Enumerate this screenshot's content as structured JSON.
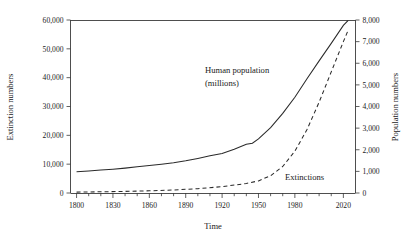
{
  "chart_data": {
    "type": "line",
    "title": "",
    "xlabel": "Time",
    "ylabel": "Extinction numbers",
    "y2label": "Population numbers",
    "grid": false,
    "legend_position": "inline-annotations",
    "xlim": [
      1795,
      2030
    ],
    "ylim": [
      0,
      60000
    ],
    "y2lim": [
      0,
      8000
    ],
    "x_tick_labels": [
      "1800",
      "1830",
      "1860",
      "1890",
      "1920",
      "1950",
      "1980",
      "2020"
    ],
    "x_tick_values": [
      1800,
      1830,
      1860,
      1890,
      1920,
      1950,
      1980,
      2020
    ],
    "x_minor_tick_step": 10,
    "y_tick_labels": [
      "0",
      "10,000",
      "20,000",
      "30,000",
      "40,000",
      "50,000",
      "60,000"
    ],
    "y_tick_values": [
      0,
      10000,
      20000,
      30000,
      40000,
      50000,
      60000
    ],
    "y2_tick_labels": [
      "0",
      "1,000",
      "2,000",
      "3,000",
      "4,000",
      "5,000",
      "6,000",
      "7,000",
      "8,000"
    ],
    "y2_tick_values": [
      0,
      1000,
      2000,
      3000,
      4000,
      5000,
      6000,
      7000,
      8000
    ],
    "series": [
      {
        "name": "Human population (millions)",
        "style": "solid",
        "axis": "right",
        "annotation": "Human population\n(millions)",
        "x": [
          1800,
          1810,
          1820,
          1830,
          1840,
          1850,
          1860,
          1870,
          1880,
          1890,
          1900,
          1910,
          1920,
          1930,
          1940,
          1945,
          1950,
          1960,
          1970,
          1980,
          1990,
          2000,
          2010,
          2020,
          2024
        ],
        "values": [
          980,
          1020,
          1060,
          1100,
          1150,
          1210,
          1270,
          1330,
          1400,
          1490,
          1600,
          1720,
          1830,
          2020,
          2250,
          2300,
          2500,
          3020,
          3680,
          4430,
          5280,
          6110,
          6920,
          7750,
          7980
        ]
      },
      {
        "name": "Extinctions",
        "style": "dashed",
        "axis": "left",
        "annotation": "Extinctions",
        "x": [
          1800,
          1820,
          1840,
          1860,
          1880,
          1900,
          1920,
          1940,
          1950,
          1960,
          1970,
          1980,
          1990,
          2000,
          2010,
          2020,
          2024
        ],
        "values": [
          300,
          420,
          560,
          760,
          1050,
          1500,
          2200,
          3300,
          4200,
          6000,
          9200,
          14500,
          22000,
          31500,
          42000,
          52500,
          56500
        ]
      }
    ],
    "annotations": [
      {
        "name": "human-population-label",
        "text_line1": "Human population",
        "text_line2": "(millions)"
      },
      {
        "name": "extinctions-label",
        "text": "Extinctions"
      }
    ]
  }
}
